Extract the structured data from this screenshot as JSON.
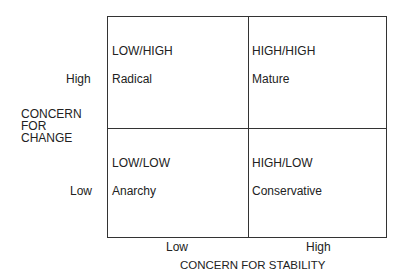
{
  "y_axis": {
    "title_lines": [
      "CONCERN",
      "FOR",
      "CHANGE"
    ],
    "ticks": {
      "high": "High",
      "low": "Low"
    }
  },
  "x_axis": {
    "title": "CONCERN FOR STABILITY",
    "ticks": {
      "low": "Low",
      "high": "High"
    }
  },
  "quadrants": [
    {
      "code": "LOW/HIGH",
      "name": "Radical"
    },
    {
      "code": "HIGH/HIGH",
      "name": "Mature"
    },
    {
      "code": "LOW/LOW",
      "name": "Anarchy"
    },
    {
      "code": "HIGH/LOW",
      "name": "Conservative"
    }
  ]
}
